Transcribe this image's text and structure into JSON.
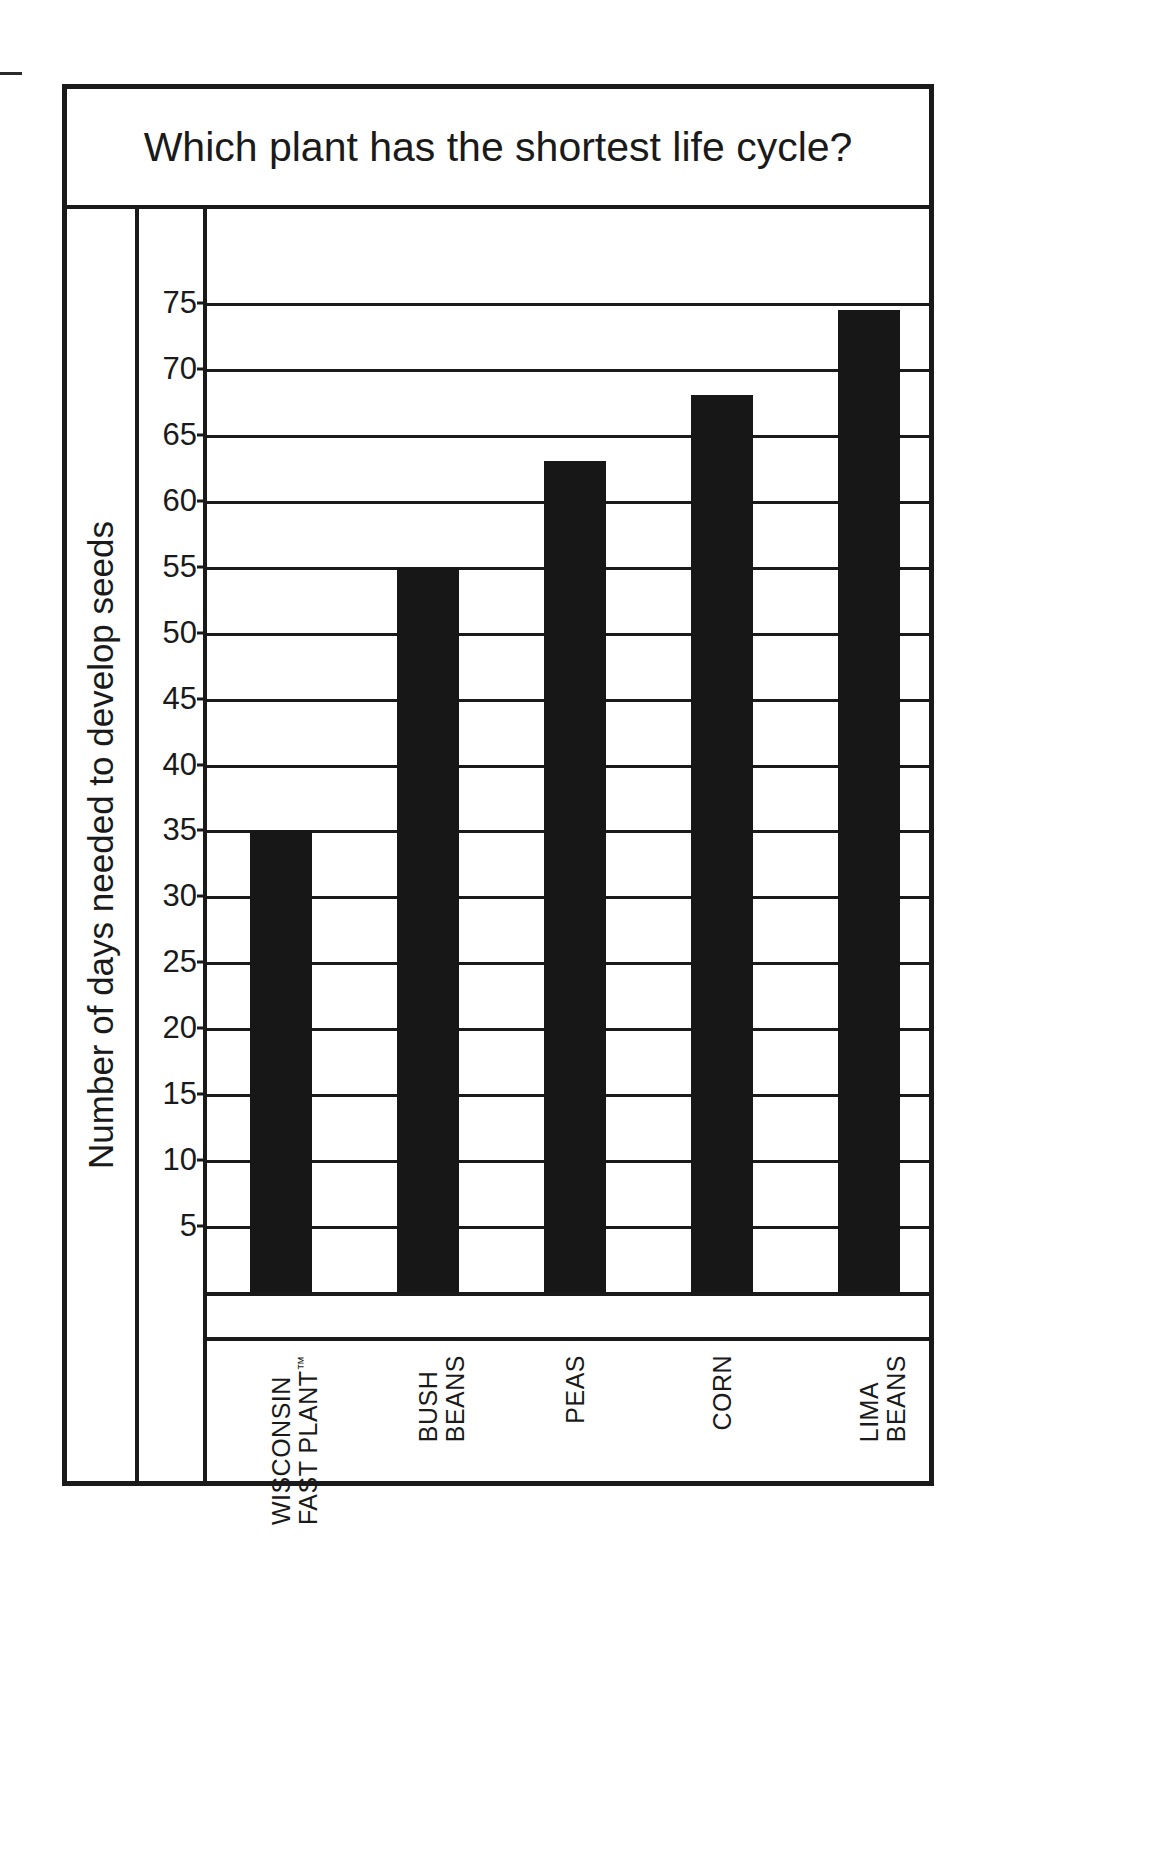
{
  "chart_data": {
    "type": "bar",
    "title": "Which plant has the shortest life cycle?",
    "xlabel": "",
    "ylabel": "Number of days needed to develop seeds",
    "categories": [
      "WISCONSIN FAST PLANT™",
      "BUSH BEANS",
      "PEAS",
      "CORN",
      "LIMA BEANS"
    ],
    "category_lines": [
      [
        "WISCONSIN",
        "FAST PLANT™"
      ],
      [
        "BUSH",
        "BEANS"
      ],
      [
        "PEAS",
        ""
      ],
      [
        "CORN",
        ""
      ],
      [
        "LIMA",
        "BEANS"
      ]
    ],
    "values": [
      35,
      55,
      63,
      68,
      74.5
    ],
    "ylim": [
      0,
      80
    ],
    "yticks": [
      75,
      70,
      65,
      60,
      55,
      50,
      45,
      40,
      35,
      30,
      25,
      20,
      15,
      10,
      5
    ],
    "ytick_labels": [
      "75",
      "70",
      "65",
      "60",
      "55",
      "50",
      "45",
      "40",
      "35",
      "30",
      "25",
      "20",
      "15",
      "10",
      "5"
    ],
    "grid": true,
    "legend": null,
    "bar_color": "#171717",
    "axis_color": "#1a1a1a",
    "background": "#ffffff"
  }
}
